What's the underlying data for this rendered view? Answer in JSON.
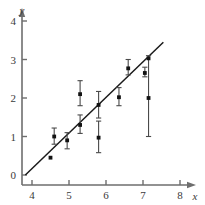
{
  "chart_data": {
    "type": "scatter",
    "title": "",
    "subtitle": "",
    "xlabel": "x",
    "ylabel": "y",
    "xlim": [
      3.45,
      8.55
    ],
    "ylim": [
      -0.55,
      4.45
    ],
    "xticks": [
      4,
      5,
      6,
      7,
      8
    ],
    "yticks": [
      0,
      1,
      2,
      3,
      4
    ],
    "xtick_labels": [
      "4",
      "5",
      "6",
      "7",
      "8"
    ],
    "ytick_labels": [
      "0",
      "1",
      "2",
      "3",
      "4"
    ],
    "grid": false,
    "legend": null,
    "axis_style": "arrow-tipped L-axes, ticks outside",
    "marker_style": "filled black square",
    "error_bar_direction": "vertical",
    "series": [
      {
        "name": "measurements",
        "points": [
          {
            "x": 4.5,
            "y": 0.45,
            "yerr_low": 0.45,
            "yerr_high": 0.45
          },
          {
            "x": 4.6,
            "y": 1.0,
            "yerr_low": 0.8,
            "yerr_high": 1.22
          },
          {
            "x": 4.95,
            "y": 0.9,
            "yerr_low": 0.68,
            "yerr_high": 1.1
          },
          {
            "x": 5.3,
            "y": 2.1,
            "yerr_low": 1.8,
            "yerr_high": 2.45
          },
          {
            "x": 5.3,
            "y": 1.3,
            "yerr_low": 1.08,
            "yerr_high": 1.56
          },
          {
            "x": 5.8,
            "y": 1.82,
            "yerr_low": 1.48,
            "yerr_high": 2.17
          },
          {
            "x": 5.8,
            "y": 0.97,
            "yerr_low": 0.58,
            "yerr_high": 1.4
          },
          {
            "x": 6.35,
            "y": 2.02,
            "yerr_low": 1.8,
            "yerr_high": 2.27
          },
          {
            "x": 6.6,
            "y": 2.77,
            "yerr_low": 2.6,
            "yerr_high": 3.0
          },
          {
            "x": 7.05,
            "y": 2.65,
            "yerr_low": 2.55,
            "yerr_high": 2.8
          },
          {
            "x": 7.15,
            "y": 3.03,
            "yerr_low": 1.0,
            "yerr_high": 3.1
          },
          {
            "x": 7.15,
            "y": 2.0,
            "yerr_low": 2.0,
            "yerr_high": 2.0
          }
        ]
      }
    ],
    "fit_line": {
      "name": "best fit line",
      "x_start": 3.82,
      "y_start": 0.0,
      "x_end": 7.55,
      "y_end": 3.45,
      "slope": 0.925,
      "intercept": -3.534
    }
  }
}
